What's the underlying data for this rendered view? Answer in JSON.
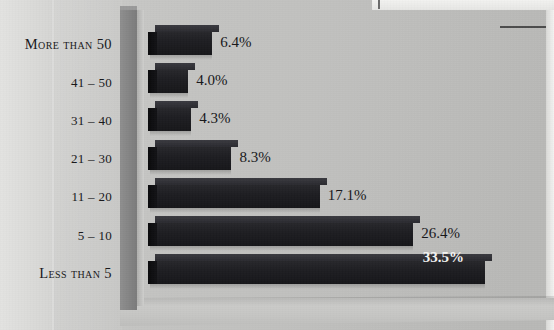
{
  "figure": {
    "background_color": "#c4c4c2",
    "bar_color": "#1e1e22",
    "axis_wall_color": "#868686",
    "label_color": "#17171a",
    "inside_label_color": "#f4f4f2",
    "page_margin_text": ""
  },
  "chart_data": {
    "type": "bar",
    "orientation": "horizontal",
    "title": "",
    "subtitle": "",
    "xlabel": "",
    "ylabel": "",
    "grid": false,
    "legend": null,
    "xlim": [
      0,
      35
    ],
    "categories": [
      "More than 50",
      "41 – 50",
      "31 – 40",
      "21 – 30",
      "11 – 20",
      "5 – 10",
      "Less than 5"
    ],
    "values": [
      6.4,
      4.0,
      4.3,
      8.3,
      17.1,
      26.4,
      33.5
    ],
    "data_labels": [
      "6.4%",
      "4.0%",
      "4.3%",
      "8.3%",
      "17.1%",
      "26.4%",
      "33.5%"
    ],
    "label_styles": [
      "outside",
      "outside",
      "outside",
      "outside",
      "outside",
      "outside",
      "inside"
    ],
    "label_smallcaps": [
      true,
      false,
      false,
      false,
      false,
      false,
      true
    ]
  }
}
